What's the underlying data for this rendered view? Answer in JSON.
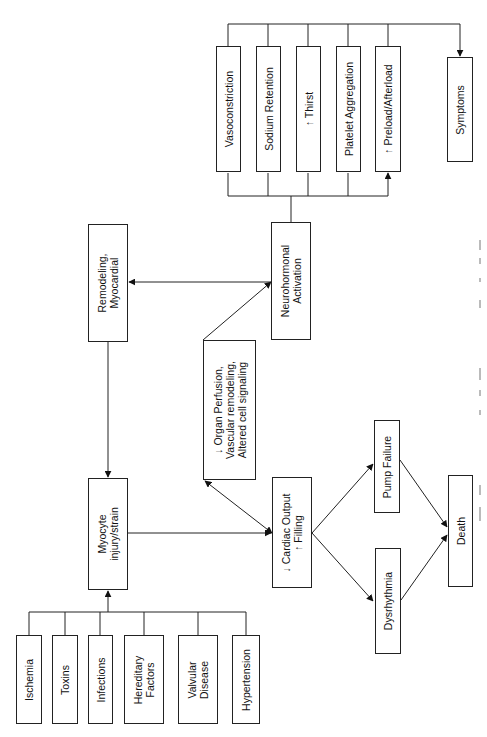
{
  "diagram": {
    "type": "flowchart",
    "orientation": "rotated-90-ccw",
    "causes": [
      {
        "id": "ischemia",
        "lines": [
          "Ischemia"
        ]
      },
      {
        "id": "toxins",
        "lines": [
          "Toxins"
        ]
      },
      {
        "id": "infections",
        "lines": [
          "Infections"
        ]
      },
      {
        "id": "hereditary",
        "lines": [
          "Hereditary",
          "Factors"
        ]
      },
      {
        "id": "valvular",
        "lines": [
          "Valvular",
          "Disease"
        ]
      },
      {
        "id": "hypertension",
        "lines": [
          "Hypertension"
        ]
      }
    ],
    "myocyte": {
      "lines": [
        "Myocyte",
        "injury/strain"
      ]
    },
    "remodeling": {
      "lines": [
        "Remodeling,",
        "Myocardial"
      ]
    },
    "cardiac_output": {
      "lines": [
        "↓ Cardiac Output",
        "↑ Filling"
      ]
    },
    "organ_perfusion": {
      "lines": [
        "↓ Organ Perfusion,",
        "Vascular remodeling,",
        "Altered cell signaling"
      ]
    },
    "neurohormonal": {
      "lines": [
        "Neurohormonal",
        "Activation"
      ]
    },
    "effects": [
      {
        "id": "vasoconstriction",
        "lines": [
          "Vasoconstriction"
        ]
      },
      {
        "id": "sodium",
        "lines": [
          "Sodium Retention"
        ]
      },
      {
        "id": "thirst",
        "lines": [
          "↑ Thirst"
        ]
      },
      {
        "id": "platelet",
        "lines": [
          "Platelet Aggregation"
        ]
      },
      {
        "id": "preload",
        "lines": [
          "↑ Preload/Afterload"
        ]
      }
    ],
    "symptoms": {
      "lines": [
        "Symptoms"
      ]
    },
    "pump_failure": {
      "lines": [
        "Pump Failure"
      ]
    },
    "dysrhythmia": {
      "lines": [
        "Dysrhythmia"
      ]
    },
    "death": {
      "lines": [
        "Death"
      ]
    },
    "edges": [
      [
        "causes",
        "myocyte"
      ],
      [
        "remodeling",
        "myocyte"
      ],
      [
        "myocyte",
        "cardiac_output"
      ],
      [
        "cardiac_output",
        "organ_perfusion"
      ],
      [
        "organ_perfusion",
        "neurohormonal"
      ],
      [
        "neurohormonal",
        "remodeling"
      ],
      [
        "neurohormonal",
        "effects"
      ],
      [
        "effects",
        "symptoms"
      ],
      [
        "cardiac_output",
        "pump_failure"
      ],
      [
        "cardiac_output",
        "dysrhythmia"
      ],
      [
        "pump_failure",
        "death"
      ],
      [
        "dysrhythmia",
        "death"
      ]
    ],
    "line_color": "#222222"
  }
}
